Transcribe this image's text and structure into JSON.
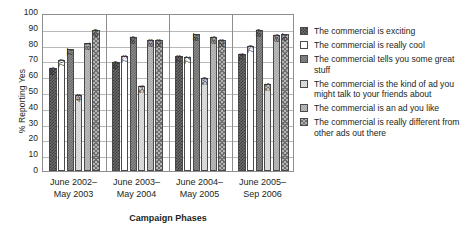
{
  "chart_data": {
    "type": "bar",
    "title": "",
    "xlabel": "Campaign Phases",
    "ylabel": "% Reporting Yes",
    "ylim": [
      0,
      100
    ],
    "ytick_step": 10,
    "yticks": [
      100,
      90,
      80,
      70,
      60,
      50,
      40,
      30,
      20,
      10,
      0
    ],
    "grid": true,
    "legend_position": "right",
    "categories": [
      "June 2002–\nMay 2003",
      "June 2003–\nMay 2004",
      "June 2004–\nMay 2005",
      "June 2005–\nSep 2006"
    ],
    "category_lines": [
      [
        "June 2002–",
        "May 2003"
      ],
      [
        "June 2003–",
        "May 2004"
      ],
      [
        "June 2004–",
        "May 2005"
      ],
      [
        "June 2005–",
        "Sep 2006"
      ]
    ],
    "series": [
      {
        "name": "The commercial is exciting",
        "pattern": "p1",
        "values": [
          65,
          69,
          73,
          74
        ]
      },
      {
        "name": "The commercial is really cool",
        "pattern": "p2",
        "values": [
          70,
          73,
          72,
          79
        ]
      },
      {
        "name": "The commercial tells you some great stuff",
        "pattern": "p3",
        "values": [
          77,
          85,
          87,
          89
        ]
      },
      {
        "name": "The commercial is the kind of ad you might talk to your friends about",
        "pattern": "p4",
        "values": [
          48,
          54,
          59,
          55
        ]
      },
      {
        "name": "The commercial is an ad you like",
        "pattern": "p5",
        "values": [
          81,
          83,
          85,
          86
        ]
      },
      {
        "name": "The commercial is really different from other ads out there",
        "pattern": "p6",
        "values": [
          89,
          83,
          83,
          87
        ]
      }
    ]
  },
  "legend": {
    "items": [
      {
        "label": "The commercial is exciting",
        "pattern": "p1"
      },
      {
        "label": "The commercial is really cool",
        "pattern": "p2"
      },
      {
        "label": "The commercial tells you some great stuff",
        "pattern": "p3"
      },
      {
        "label": "The commercial is the kind of ad you might talk to your friends about",
        "pattern": "p4"
      },
      {
        "label": "The commercial is an ad you like",
        "pattern": "p5"
      },
      {
        "label": "The commercial is really different from other ads out there",
        "pattern": "p6"
      }
    ]
  }
}
